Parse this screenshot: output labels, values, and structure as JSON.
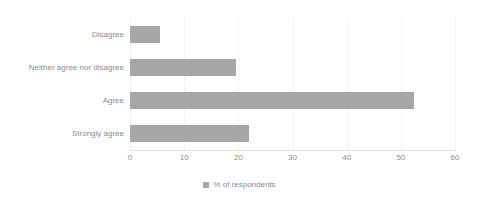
{
  "chart_data": {
    "type": "bar",
    "orientation": "horizontal",
    "title": "",
    "xlabel": "",
    "ylabel": "",
    "categories": [
      "Disagree",
      "Neither agree nor disagree",
      "Agree",
      "Strongly agree"
    ],
    "values": [
      5.5,
      19.5,
      52.5,
      22
    ],
    "series": [
      {
        "name": "% of respondents",
        "values": [
          5.5,
          19.5,
          52.5,
          22
        ]
      }
    ],
    "xlim": [
      0,
      60
    ],
    "xticks": [
      0,
      10,
      20,
      30,
      40,
      50,
      60
    ],
    "xticklabels": [
      "0",
      "10",
      "20",
      "30",
      "40",
      "50",
      "60"
    ],
    "grid": true,
    "grid_axis": "x",
    "legend": {
      "position": "bottom-center",
      "entries": [
        {
          "label": "% of respondents",
          "color": "#a6a6a6"
        }
      ]
    },
    "colors": {
      "bar": "#a6a6a6",
      "text": "#8c8c8c",
      "gridline": "#f2f2f2",
      "axis": "#e3e3e3",
      "background": "#ffffff"
    }
  }
}
